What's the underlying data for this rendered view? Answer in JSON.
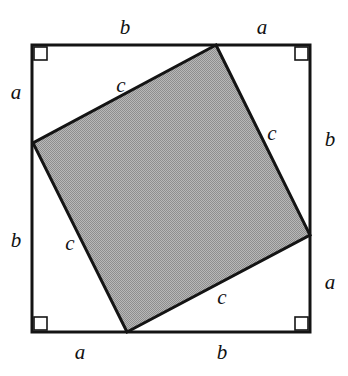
{
  "figure": {
    "colors": {
      "stroke": "#141414",
      "fill_gray": "#a8a8a8",
      "background": "#ffffff",
      "label_color": "#111111"
    },
    "outer_square": {
      "name": "outer-square",
      "x1": 32,
      "y1": 45,
      "x2": 310,
      "y2": 332,
      "stroke_width": 3
    },
    "inner_square": {
      "name": "inner-tilted-square",
      "points": "216,45 310,235 127,332 33,143",
      "fill": "#a8a8a8",
      "stroke_width": 3
    },
    "right_angle_markers": [
      {
        "name": "right-angle-marker-top-left",
        "x": 34,
        "y": 47,
        "size": 13
      },
      {
        "name": "right-angle-marker-top-right",
        "x": 295,
        "y": 47,
        "size": 13
      },
      {
        "name": "right-angle-marker-bottom-left",
        "x": 34,
        "y": 317,
        "size": 13
      },
      {
        "name": "right-angle-marker-bottom-right",
        "x": 295,
        "y": 317,
        "size": 13
      }
    ],
    "labels": [
      {
        "name": "label-top-b",
        "text": "b",
        "x": 125,
        "y": 27,
        "side": "top",
        "segment": "b"
      },
      {
        "name": "label-top-a",
        "text": "a",
        "x": 262,
        "y": 27,
        "side": "top",
        "segment": "a"
      },
      {
        "name": "label-right-b",
        "text": "b",
        "x": 330,
        "y": 139,
        "side": "right",
        "segment": "b"
      },
      {
        "name": "label-right-a",
        "text": "a",
        "x": 330,
        "y": 282,
        "side": "right",
        "segment": "a"
      },
      {
        "name": "label-bottom-a",
        "text": "a",
        "x": 80,
        "y": 352,
        "side": "bottom",
        "segment": "a"
      },
      {
        "name": "label-bottom-b",
        "text": "b",
        "x": 222,
        "y": 352,
        "side": "bottom",
        "segment": "b"
      },
      {
        "name": "label-left-a",
        "text": "a",
        "x": 16,
        "y": 92,
        "side": "left",
        "segment": "a"
      },
      {
        "name": "label-left-b",
        "text": "b",
        "x": 16,
        "y": 240,
        "side": "left",
        "segment": "b"
      },
      {
        "name": "label-hypotenuse-top-left",
        "text": "c",
        "x": 121,
        "y": 85,
        "side": "inner",
        "segment": "c"
      },
      {
        "name": "label-hypotenuse-top-right",
        "text": "c",
        "x": 272,
        "y": 133,
        "side": "inner",
        "segment": "c"
      },
      {
        "name": "label-hypotenuse-bottom-left",
        "text": "c",
        "x": 70,
        "y": 243,
        "side": "inner",
        "segment": "c"
      },
      {
        "name": "label-hypotenuse-bottom-right",
        "text": "c",
        "x": 222,
        "y": 297,
        "side": "inner",
        "segment": "c"
      }
    ]
  }
}
